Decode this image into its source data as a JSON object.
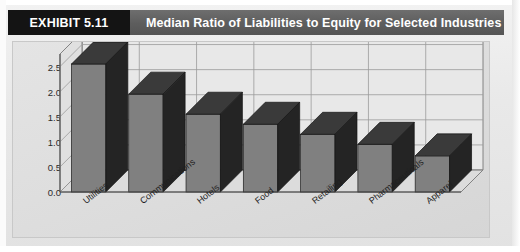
{
  "header": {
    "exhibit_tag": "EXHIBIT 5.11",
    "title": "Median Ratio of Liabilities to Equity for Selected Industries"
  },
  "colors": {
    "tag_background": "#141414",
    "header_background": "#5d5d5d",
    "header_text": "#ffffff",
    "panel_background": "#dedede",
    "bar_front": "#808080",
    "bar_top": "#3a3a3a",
    "bar_side": "#242424",
    "gridline": "#9a9a9a",
    "axis": "#6b6b6b",
    "page_background": "#eaeaea"
  },
  "chart_data": {
    "type": "bar",
    "title": "Median Ratio of Liabilities to Equity for Selected Industries",
    "xlabel": "",
    "ylabel": "",
    "categories": [
      "Utilities",
      "Communications",
      "Hotels",
      "Food",
      "Retailing",
      "Pharmaceuticals",
      "Apparel"
    ],
    "values": [
      2.55,
      1.95,
      1.55,
      1.35,
      1.15,
      0.95,
      0.72
    ],
    "ylim": [
      0.0,
      2.75
    ],
    "yticks": [
      0.0,
      0.5,
      1.0,
      1.5,
      2.0,
      2.5
    ],
    "ytick_labels": [
      "0.0",
      "0.5",
      "1.0",
      "1.5",
      "2.0",
      "2.5"
    ],
    "grid": true,
    "legend": false,
    "three_d": true
  }
}
